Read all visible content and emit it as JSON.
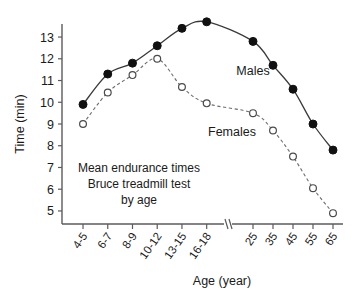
{
  "chart_data": {
    "type": "line",
    "title": "",
    "annotation_lines": [
      "Mean endurance times",
      "Bruce treadmill test",
      "by age"
    ],
    "xlabel": "Age (year)",
    "ylabel": "Time (min)",
    "categories": [
      "4-5",
      "6-7",
      "8-9",
      "10-12",
      "13-15",
      "16-18",
      "25",
      "35",
      "45",
      "55",
      "65"
    ],
    "ylim": [
      4.4,
      13.6
    ],
    "yticks": [
      5,
      6,
      7,
      8,
      9,
      10,
      11,
      12,
      13
    ],
    "ytick_labels": [
      "5",
      "6",
      "7",
      "8",
      "9",
      "10",
      "11",
      "12",
      "13"
    ],
    "grid": false,
    "axis_break_after_category": "16-18",
    "legend_position": "inline-labels",
    "series": [
      {
        "name": "Males",
        "marker": "filled-circle",
        "linestyle": "solid",
        "color": "#111111",
        "values": [
          9.9,
          11.3,
          11.8,
          12.6,
          13.4,
          13.7,
          12.8,
          11.7,
          10.6,
          9.0,
          7.8
        ]
      },
      {
        "name": "Females",
        "marker": "open-circle",
        "linestyle": "dashed",
        "color": "#4a4a4a",
        "values": [
          9.0,
          10.45,
          11.25,
          12.0,
          10.7,
          9.95,
          9.5,
          8.7,
          7.5,
          6.05,
          4.9
        ]
      }
    ]
  }
}
